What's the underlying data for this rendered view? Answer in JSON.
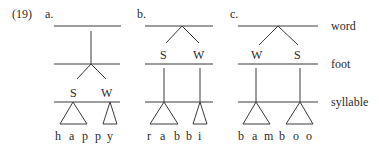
{
  "example_number": "(19)",
  "level_labels": {
    "word": "word",
    "foot": "foot",
    "syllable": "syllable"
  },
  "trees": [
    {
      "label": "a.",
      "foot_labels": [
        "S",
        "W"
      ],
      "segments": [
        "h",
        "a",
        "p",
        "p",
        "y"
      ],
      "word": "happy"
    },
    {
      "label": "b.",
      "foot_labels": [
        "S",
        "W"
      ],
      "segments": [
        "r",
        "a",
        "b",
        "b",
        "i"
      ],
      "word": "rabbi"
    },
    {
      "label": "c.",
      "foot_labels": [
        "W",
        "S"
      ],
      "segments": [
        "b",
        "a",
        "m",
        "b",
        "o",
        "o"
      ],
      "word": "bamboo"
    }
  ]
}
